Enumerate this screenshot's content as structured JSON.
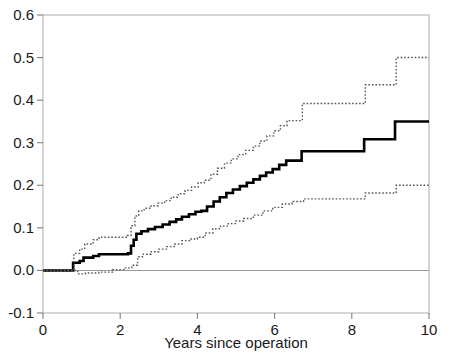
{
  "chart_data": {
    "type": "line",
    "subtype": "step-function cumulative incidence with pointwise confidence limits",
    "title": "",
    "xlabel": "Years since operation",
    "ylabel": "",
    "xlim": [
      0,
      10
    ],
    "ylim": [
      -0.1,
      0.6
    ],
    "xticks": [
      0,
      2,
      4,
      6,
      8,
      10
    ],
    "xtick_labels": [
      "0",
      "2",
      "4",
      "6",
      "8",
      "10"
    ],
    "yticks": [
      -0.1,
      0.0,
      0.1,
      0.2,
      0.3,
      0.4,
      0.5,
      0.6
    ],
    "ytick_labels": [
      "-0.1",
      "0.0",
      "0.1",
      "0.2",
      "0.3",
      "0.4",
      "0.5",
      "0.6"
    ],
    "grid": false,
    "legend": "none",
    "reference_line_y": 0.0,
    "series": [
      {
        "name": "estimate",
        "style": "solid",
        "color": "#000000",
        "linewidth": 2.6,
        "step": "post",
        "x": [
          0.0,
          0.72,
          0.78,
          0.95,
          1.05,
          1.3,
          1.45,
          2.05,
          2.2,
          2.28,
          2.35,
          2.42,
          2.55,
          2.72,
          2.9,
          3.1,
          3.28,
          3.45,
          3.6,
          3.78,
          3.95,
          4.1,
          4.25,
          4.42,
          4.58,
          4.75,
          4.92,
          5.1,
          5.28,
          5.45,
          5.62,
          5.78,
          5.95,
          6.12,
          6.3,
          6.7,
          8.32,
          9.12,
          10.0
        ],
        "y": [
          0.0,
          0.0,
          0.018,
          0.022,
          0.03,
          0.034,
          0.038,
          0.038,
          0.04,
          0.058,
          0.072,
          0.086,
          0.092,
          0.097,
          0.102,
          0.108,
          0.114,
          0.12,
          0.126,
          0.132,
          0.138,
          0.14,
          0.15,
          0.162,
          0.172,
          0.182,
          0.19,
          0.198,
          0.206,
          0.214,
          0.222,
          0.23,
          0.238,
          0.248,
          0.258,
          0.28,
          0.308,
          0.35,
          0.35
        ]
      },
      {
        "name": "upper confidence limit",
        "style": "dotted",
        "color": "#555555",
        "linewidth": 1.4,
        "step": "post",
        "x": [
          0.0,
          0.72,
          0.8,
          0.95,
          1.08,
          1.3,
          1.45,
          2.05,
          2.18,
          2.28,
          2.38,
          2.48,
          2.62,
          2.8,
          2.98,
          3.15,
          3.32,
          3.5,
          3.68,
          3.85,
          4.02,
          4.18,
          4.35,
          4.52,
          4.7,
          4.88,
          5.05,
          5.25,
          5.45,
          5.62,
          5.8,
          5.98,
          6.15,
          6.32,
          6.72,
          8.35,
          9.15,
          10.0
        ],
        "y": [
          0.0,
          0.0,
          0.04,
          0.05,
          0.062,
          0.072,
          0.078,
          0.078,
          0.082,
          0.105,
          0.128,
          0.14,
          0.146,
          0.152,
          0.158,
          0.164,
          0.172,
          0.18,
          0.188,
          0.196,
          0.206,
          0.212,
          0.226,
          0.24,
          0.252,
          0.262,
          0.272,
          0.282,
          0.292,
          0.304,
          0.316,
          0.328,
          0.34,
          0.352,
          0.392,
          0.436,
          0.5,
          0.5
        ]
      },
      {
        "name": "lower confidence limit",
        "style": "dotted",
        "color": "#555555",
        "linewidth": 1.4,
        "step": "post",
        "x": [
          0.0,
          0.75,
          0.9,
          1.1,
          1.45,
          1.8,
          2.1,
          2.3,
          2.45,
          2.6,
          2.8,
          3.0,
          3.2,
          3.4,
          3.6,
          3.8,
          4.0,
          4.2,
          4.4,
          4.6,
          4.8,
          5.0,
          5.2,
          5.45,
          5.7,
          5.95,
          6.2,
          6.45,
          6.75,
          8.35,
          9.15,
          10.0
        ],
        "y": [
          0.0,
          0.0,
          -0.008,
          -0.006,
          -0.004,
          0.002,
          0.006,
          0.012,
          0.032,
          0.038,
          0.044,
          0.05,
          0.056,
          0.062,
          0.07,
          0.074,
          0.078,
          0.088,
          0.098,
          0.104,
          0.11,
          0.116,
          0.122,
          0.13,
          0.14,
          0.148,
          0.156,
          0.162,
          0.168,
          0.182,
          0.2,
          0.2
        ]
      }
    ]
  },
  "axes": {
    "x_title": "Years since operation"
  }
}
